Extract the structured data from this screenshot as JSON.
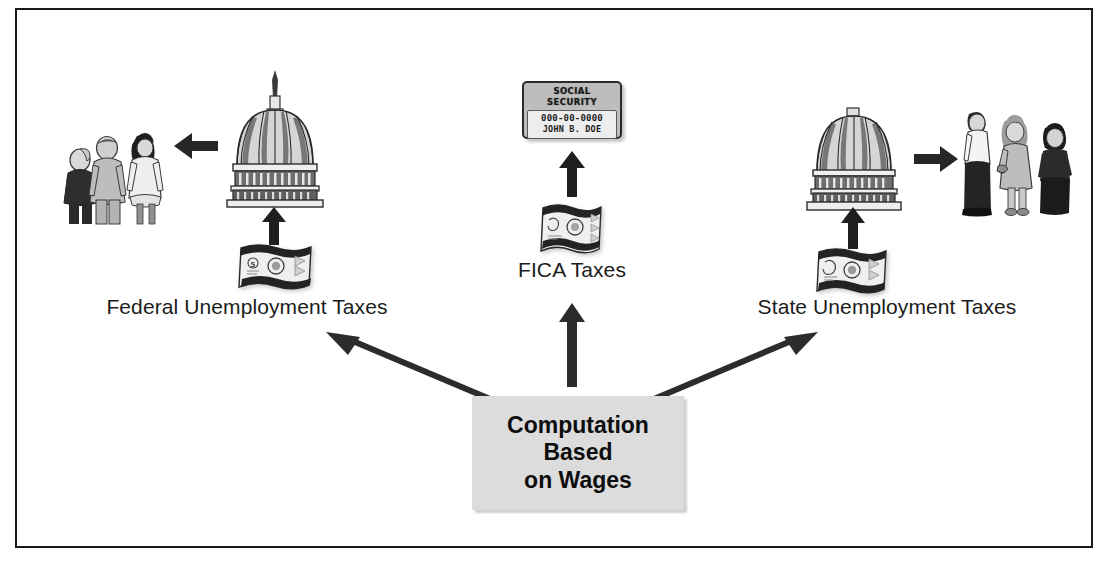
{
  "diagram": {
    "type": "flow-diagram",
    "background_color": "#ffffff",
    "border_color": "#1a1a1a",
    "accent_box_color": "#dcdcdc"
  },
  "source_box": {
    "line1": "Computation",
    "line2": "Based",
    "line3": "on Wages"
  },
  "branches": {
    "left": {
      "label": "Federal Unemployment Taxes",
      "icon_money": "banknote-icon",
      "icon_destination": "capitol-dome-icon",
      "icon_recipients": "people-group-icon",
      "arrow_direction": "left"
    },
    "center": {
      "label": "FICA Taxes",
      "icon_money": "banknote-icon",
      "icon_destination": "social-security-card-icon",
      "arrow_direction": "up"
    },
    "right": {
      "label": "State Unemployment Taxes",
      "icon_money": "banknote-icon",
      "icon_destination": "capitol-dome-icon",
      "icon_recipients": "people-group-icon",
      "arrow_direction": "right"
    }
  },
  "social_security_card": {
    "title": "SOCIAL SECURITY",
    "number": "000-00-0000",
    "name": "JOHN B. DOE"
  }
}
